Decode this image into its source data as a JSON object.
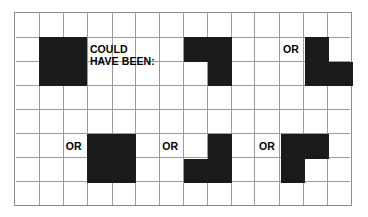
{
  "figure": {
    "name": "tetromino-could-have-been-grid",
    "background_color": "#ffffff",
    "block_color": "#1a1a1a",
    "grid_line_color": "#9a9a9a",
    "border_color": "#8d8d8d",
    "columns": 14,
    "rows": 8,
    "cell_size": 24.1
  },
  "caption": {
    "line1": "COULD",
    "line2": "HAVE BEEN:"
  },
  "or_labels": [
    {
      "text": "OR",
      "col": 11,
      "row": 1
    },
    {
      "text": "OR",
      "col": 2,
      "row": 5
    },
    {
      "text": "OR",
      "col": 6,
      "row": 5
    },
    {
      "text": "OR",
      "col": 10,
      "row": 5
    }
  ],
  "shapes": [
    {
      "name": "square-tetromino-top-left",
      "cells": [
        [
          1,
          1
        ],
        [
          2,
          1
        ],
        [
          1,
          2
        ],
        [
          2,
          2
        ]
      ]
    },
    {
      "name": "j-tetromino-top-middle",
      "cells": [
        [
          7,
          1
        ],
        [
          8,
          1
        ],
        [
          8,
          2
        ]
      ]
    },
    {
      "name": "s-tetromino-top-right",
      "cells": [
        [
          12,
          1
        ],
        [
          12,
          2
        ],
        [
          13,
          2
        ]
      ]
    },
    {
      "name": "square-tetromino-bottom-left",
      "cells": [
        [
          3,
          5
        ],
        [
          4,
          5
        ],
        [
          3,
          6
        ],
        [
          4,
          6
        ]
      ]
    },
    {
      "name": "s-tetromino-bottom-middle",
      "cells": [
        [
          8,
          5
        ],
        [
          7,
          6
        ],
        [
          8,
          6
        ]
      ]
    },
    {
      "name": "j-tetromino-bottom-right",
      "cells": [
        [
          11,
          5
        ],
        [
          12,
          5
        ],
        [
          11,
          6
        ]
      ]
    }
  ]
}
